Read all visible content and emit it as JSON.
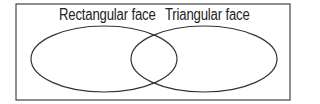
{
  "diagram": {
    "type": "venn",
    "sets": [
      {
        "label": "Rectangular face"
      },
      {
        "label": "Triangular face"
      }
    ],
    "colors": {
      "stroke": "#333333",
      "background": "#ffffff"
    }
  }
}
